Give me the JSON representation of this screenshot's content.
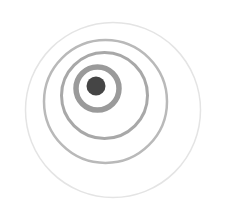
{
  "figure": {
    "width": 226,
    "height": 205,
    "background": "#ffffff",
    "rings": [
      {
        "name": "outer-ring",
        "cx": 113,
        "cy": 110,
        "r": 87.5,
        "stroke": "#e4e4e4",
        "stroke_width": 1.5
      },
      {
        "name": "second-ring",
        "cx": 105.5,
        "cy": 101.5,
        "r": 61.5,
        "stroke": "#b9b9b9",
        "stroke_width": 2.5
      },
      {
        "name": "third-ring",
        "cx": 104.5,
        "cy": 95.5,
        "r": 43,
        "stroke": "#a8a8a8",
        "stroke_width": 3
      },
      {
        "name": "inner-ring",
        "cx": 97.5,
        "cy": 88.5,
        "r": 21.5,
        "stroke": "#9a9a9a",
        "stroke_width": 5.5
      }
    ],
    "dot": {
      "cx": 96,
      "cy": 86,
      "r": 9.5,
      "fill": "#454545"
    }
  }
}
